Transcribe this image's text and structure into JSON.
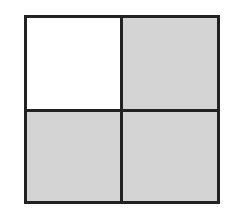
{
  "diagram": {
    "rows": 2,
    "cols": 2,
    "cells": [
      {
        "position": "top-left",
        "shaded": false,
        "color": "#ffffff"
      },
      {
        "position": "top-right",
        "shaded": true,
        "color": "#d4d4d4"
      },
      {
        "position": "bottom-left",
        "shaded": true,
        "color": "#d4d4d4"
      },
      {
        "position": "bottom-right",
        "shaded": true,
        "color": "#d4d4d4"
      }
    ],
    "border_color": "#222222"
  }
}
